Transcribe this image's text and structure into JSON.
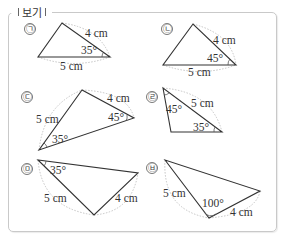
{
  "box": {
    "title": "보기"
  },
  "items": [
    {
      "marker": "㉠",
      "side_a": "4 cm",
      "side_b": "5 cm",
      "angle": "35°"
    },
    {
      "marker": "㉡",
      "side_a": "4 cm",
      "side_b": "5 cm",
      "angle": "45°"
    },
    {
      "marker": "㉢",
      "side_a": "5 cm",
      "side_b": "4 cm",
      "angle_a": "45°",
      "angle_b": "35°"
    },
    {
      "marker": "㉣",
      "side_a": "5 cm",
      "angle_a": "45°",
      "angle_b": "35°"
    },
    {
      "marker": "㉤",
      "side_a": "5 cm",
      "side_b": "4 cm",
      "angle": "35°"
    },
    {
      "marker": "㉥",
      "side_a": "5 cm",
      "side_b": "4 cm",
      "angle": "100°"
    }
  ],
  "colors": {
    "line": "#333333",
    "dotted": "#bdbdbd",
    "border": "#c9c9c9"
  }
}
